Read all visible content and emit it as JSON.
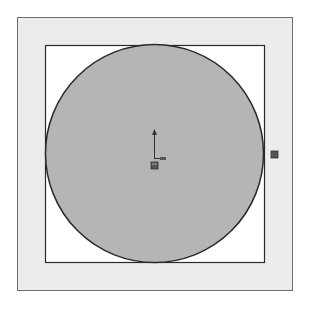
{
  "canvas": {
    "width": 310,
    "height": 311,
    "background": "#ffffff"
  },
  "outer_frame": {
    "x": 17,
    "y": 17,
    "width": 275,
    "height": 273,
    "fill": "#ececec",
    "stroke": "#6e6e6e"
  },
  "inner_square": {
    "x": 45,
    "y": 45,
    "width": 219,
    "height": 217,
    "fill": "#ffffff",
    "stroke": "#2a2a2a"
  },
  "circle": {
    "cx": 154.5,
    "cy": 153.5,
    "r": 109,
    "fill": "#b5b5b5",
    "stroke": "#2a2a2a"
  },
  "origin_marker": {
    "x": 154,
    "y": 159,
    "color": "#333333"
  },
  "side_marker": {
    "x": 274,
    "y": 154,
    "color": "#444444"
  }
}
